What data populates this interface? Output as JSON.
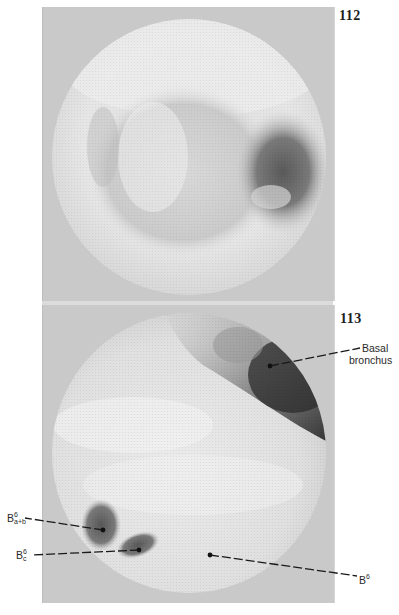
{
  "figures": [
    {
      "number": "112",
      "description": "endoscopic view of bronchial lumen",
      "labels": []
    },
    {
      "number": "113",
      "description": "endoscopic view with labeled bronchi",
      "labels": [
        {
          "id": "basal",
          "line1": "Basal",
          "line2": "bronchus"
        },
        {
          "id": "b6ab",
          "base": "B",
          "sup": "6",
          "sub": "a+b"
        },
        {
          "id": "b6c",
          "base": "B",
          "sup": "6",
          "sub": "c"
        },
        {
          "id": "b6",
          "base": "B",
          "sup": "6"
        }
      ]
    }
  ],
  "colors": {
    "frame_background": "#c9c9c9",
    "mucosa_light": "#e8e8e8",
    "lumen_dark": "#555555",
    "label_text": "#2a2a2a"
  }
}
